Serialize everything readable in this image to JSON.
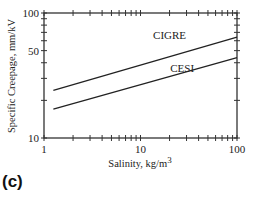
{
  "panel_label": "(c)",
  "chart_data": {
    "type": "line",
    "title": "",
    "xlabel": "Salinity, kg/m",
    "xlabel_superscript": "3",
    "ylabel": "Specific Creepage, mm/kV",
    "xscale": "log",
    "yscale": "log",
    "xlim": [
      1,
      100
    ],
    "ylim": [
      10,
      100
    ],
    "xticks": [
      1,
      10,
      100
    ],
    "xtick_labels": [
      "1",
      "10",
      "100"
    ],
    "yticks": [
      10,
      50,
      100
    ],
    "ytick_labels": [
      "10",
      "50",
      "100"
    ],
    "grid": false,
    "legend": "inline labels",
    "series": [
      {
        "name": "CIGRE",
        "x": [
          1.25,
          100
        ],
        "y": [
          24,
          64
        ],
        "label_pos": {
          "x": 20,
          "y": 62
        }
      },
      {
        "name": "CESI",
        "x": [
          1.25,
          100
        ],
        "y": [
          17,
          44
        ],
        "label_pos": {
          "x": 27,
          "y": 34
        }
      }
    ]
  }
}
